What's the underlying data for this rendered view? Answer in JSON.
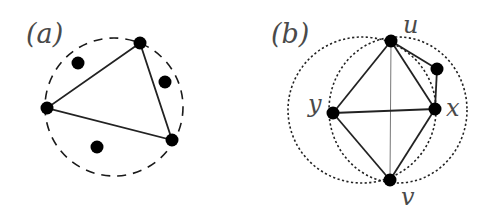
{
  "figure": {
    "panels": [
      {
        "label": "(a)",
        "circle": {
          "cx": 114,
          "cy": 107,
          "r": 69,
          "style": "dashed"
        },
        "triangle_vertices": [
          {
            "x": 140,
            "y": 43
          },
          {
            "x": 47,
            "y": 108
          },
          {
            "x": 172,
            "y": 140
          }
        ],
        "other_points": [
          {
            "x": 78,
            "y": 63
          },
          {
            "x": 165,
            "y": 82
          },
          {
            "x": 97,
            "y": 147
          }
        ]
      },
      {
        "label": "(b)",
        "vertices": {
          "u": {
            "label": "u",
            "x": 391,
            "y": 41
          },
          "v": {
            "label": "v",
            "x": 390,
            "y": 180
          },
          "x": {
            "label": "x",
            "x": 435,
            "y": 109
          },
          "y": {
            "label": "y",
            "x": 333,
            "y": 113
          },
          "w": {
            "label": "",
            "x": 437,
            "y": 69
          }
        },
        "edges": [
          [
            "u",
            "y"
          ],
          [
            "u",
            "x"
          ],
          [
            "y",
            "v"
          ],
          [
            "x",
            "v"
          ],
          [
            "y",
            "x"
          ],
          [
            "u",
            "w"
          ],
          [
            "w",
            "x"
          ],
          [
            "u",
            "v"
          ]
        ],
        "circles": [
          {
            "name": "circle-through-u-v-x",
            "style": "dotted"
          },
          {
            "name": "circle-through-u-v-y",
            "style": "dotted"
          }
        ]
      }
    ]
  },
  "labels": {
    "panel_a": "(a)",
    "panel_b": "(b)",
    "u": "u",
    "v": "v",
    "x": "x",
    "y": "y"
  }
}
